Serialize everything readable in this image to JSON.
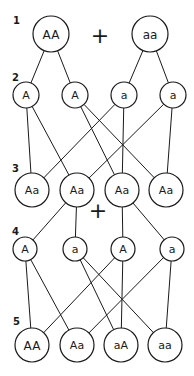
{
  "diagram": {
    "generations": [
      {
        "label": "1",
        "x": 13,
        "y": 24
      },
      {
        "label": "2",
        "x": 12,
        "y": 81
      },
      {
        "label": "3",
        "x": 12,
        "y": 172
      },
      {
        "label": "4",
        "x": 12,
        "y": 235
      },
      {
        "label": "5",
        "x": 13,
        "y": 325
      }
    ],
    "plus_signs": [
      {
        "text": "+",
        "x": 100,
        "y": 35
      },
      {
        "text": "+",
        "x": 98,
        "y": 210
      }
    ],
    "nodes": [
      {
        "id": "p1",
        "text": "AA",
        "x": 51,
        "y": 34,
        "r": 18,
        "fs": 12
      },
      {
        "id": "p2",
        "text": "aa",
        "x": 150,
        "y": 34,
        "r": 18,
        "fs": 12
      },
      {
        "id": "g1",
        "text": "A",
        "x": 26,
        "y": 95,
        "r": 13,
        "fs": 11
      },
      {
        "id": "g2",
        "text": "A",
        "x": 75,
        "y": 95,
        "r": 13,
        "fs": 11
      },
      {
        "id": "g3",
        "text": "a",
        "x": 124,
        "y": 95,
        "r": 13,
        "fs": 11
      },
      {
        "id": "g4",
        "text": "a",
        "x": 173,
        "y": 95,
        "r": 13,
        "fs": 11
      },
      {
        "id": "f1a",
        "text": "Aa",
        "x": 32,
        "y": 190,
        "r": 17,
        "fs": 11
      },
      {
        "id": "f1b",
        "text": "Aa",
        "x": 77,
        "y": 190,
        "r": 17,
        "fs": 11
      },
      {
        "id": "f1c",
        "text": "Aa",
        "x": 122,
        "y": 190,
        "r": 17,
        "fs": 11
      },
      {
        "id": "f1d",
        "text": "Aa",
        "x": 166,
        "y": 190,
        "r": 17,
        "fs": 11
      },
      {
        "id": "h1",
        "text": "A",
        "x": 25,
        "y": 249,
        "r": 12,
        "fs": 11
      },
      {
        "id": "h2",
        "text": "a",
        "x": 75,
        "y": 249,
        "r": 12,
        "fs": 11
      },
      {
        "id": "h3",
        "text": "A",
        "x": 123,
        "y": 249,
        "r": 12,
        "fs": 11
      },
      {
        "id": "h4",
        "text": "a",
        "x": 172,
        "y": 249,
        "r": 12,
        "fs": 11
      },
      {
        "id": "f2a",
        "text": "AA",
        "x": 32,
        "y": 345,
        "r": 17,
        "fs": 12
      },
      {
        "id": "f2b",
        "text": "Aa",
        "x": 77,
        "y": 345,
        "r": 17,
        "fs": 11
      },
      {
        "id": "f2c",
        "text": "aA",
        "x": 121,
        "y": 345,
        "r": 17,
        "fs": 11
      },
      {
        "id": "f2d",
        "text": "aa",
        "x": 165,
        "y": 345,
        "r": 17,
        "fs": 11
      }
    ],
    "edges": [
      [
        "p1",
        "g1"
      ],
      [
        "p1",
        "g2"
      ],
      [
        "p2",
        "g3"
      ],
      [
        "p2",
        "g4"
      ],
      [
        "g1",
        "f1a"
      ],
      [
        "g1",
        "f1b"
      ],
      [
        "g2",
        "f1c"
      ],
      [
        "g2",
        "f1d"
      ],
      [
        "g3",
        "f1a"
      ],
      [
        "g3",
        "f1c"
      ],
      [
        "g4",
        "f1b"
      ],
      [
        "g4",
        "f1d"
      ],
      [
        "f1b",
        "h1"
      ],
      [
        "f1b",
        "h2"
      ],
      [
        "f1c",
        "h3"
      ],
      [
        "f1c",
        "h4"
      ],
      [
        "h1",
        "f2a"
      ],
      [
        "h1",
        "f2b"
      ],
      [
        "h2",
        "f2c"
      ],
      [
        "h2",
        "f2d"
      ],
      [
        "h3",
        "f2a"
      ],
      [
        "h3",
        "f2c"
      ],
      [
        "h4",
        "f2b"
      ],
      [
        "h4",
        "f2d"
      ]
    ]
  }
}
